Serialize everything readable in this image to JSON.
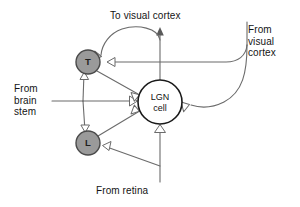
{
  "diagram": {
    "background_color": "#ffffff",
    "wire_color": "#6b6b6b",
    "interneuron_fill": "#9a9a9a",
    "interneuron_stroke": "#4a4a4a",
    "relay_fill": "#ffffff",
    "relay_stroke": "#1a1a1a",
    "labels": {
      "to_visual_cortex": "To visual cortex",
      "from_visual_cortex": "From\nvisual\ncortex",
      "from_brain_stem": "From\nbrain\nstem",
      "from_retina": "From retina"
    },
    "nodes": {
      "relay": {
        "id": "lgn-cell",
        "line1": "LGN",
        "line2": "cell",
        "cx": 160,
        "cy": 102,
        "r": 22
      },
      "interneuron_t": {
        "id": "t-cell",
        "letter": "T",
        "cx": 88,
        "cy": 62,
        "r": 12
      },
      "interneuron_l": {
        "id": "l-cell",
        "letter": "L",
        "cx": 88,
        "cy": 143,
        "r": 12
      }
    },
    "connections": [
      {
        "from": "retina",
        "to": "lgn-cell",
        "type": "excitatory-terminal"
      },
      {
        "from": "retina",
        "to": "l-cell",
        "type": "excitatory-terminal"
      },
      {
        "from": "visual-cortex",
        "to": "t-cell",
        "type": "excitatory-terminal"
      },
      {
        "from": "visual-cortex",
        "to": "lgn-cell",
        "type": "excitatory-terminal"
      },
      {
        "from": "brain-stem",
        "to": "t-cell",
        "type": "excitatory-terminal"
      },
      {
        "from": "brain-stem",
        "to": "lgn-cell",
        "type": "excitatory-terminal"
      },
      {
        "from": "brain-stem",
        "to": "l-cell",
        "type": "excitatory-terminal"
      },
      {
        "from": "t-cell",
        "to": "lgn-cell",
        "type": "inhibitory-terminal"
      },
      {
        "from": "l-cell",
        "to": "lgn-cell",
        "type": "inhibitory-terminal"
      },
      {
        "from": "lgn-cell-axon",
        "to": "t-cell",
        "type": "axon-collateral"
      },
      {
        "from": "lgn-cell",
        "to": "visual-cortex",
        "type": "axon-output"
      }
    ]
  }
}
